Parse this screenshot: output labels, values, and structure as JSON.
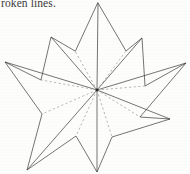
{
  "page": {
    "background_color": "#fdfdfc",
    "width": 190,
    "height": 174
  },
  "caption": {
    "text_fragment": "roken lines.",
    "color": "#2b2b2b"
  },
  "figure": {
    "name": "eight-pointed-star-polygon",
    "stroke_color": "#3a3a3a",
    "dash_color": "#9a9a9a",
    "stroke_width": 0.7,
    "center": {
      "x": 97,
      "y": 90
    },
    "outer_points": [
      {
        "label": "N",
        "x": 98,
        "y": 3
      },
      {
        "label": "NE",
        "x": 142,
        "y": 38
      },
      {
        "label": "E",
        "x": 186,
        "y": 63
      },
      {
        "label": "SE",
        "x": 170,
        "y": 119
      },
      {
        "label": "S",
        "x": 97,
        "y": 172
      },
      {
        "label": "SW",
        "x": 27,
        "y": 170
      },
      {
        "label": "W",
        "x": 5,
        "y": 62
      },
      {
        "label": "NW",
        "x": 51,
        "y": 37
      }
    ],
    "inner_points": [
      {
        "label": "i1",
        "x": 126,
        "y": 51
      },
      {
        "label": "i2",
        "x": 145,
        "y": 86
      },
      {
        "label": "i3",
        "x": 140,
        "y": 117
      },
      {
        "label": "i4",
        "x": 112,
        "y": 137
      },
      {
        "label": "i5",
        "x": 76,
        "y": 136
      },
      {
        "label": "i6",
        "x": 42,
        "y": 114
      },
      {
        "label": "i7",
        "x": 41,
        "y": 80
      },
      {
        "label": "i8",
        "x": 75,
        "y": 51
      }
    ],
    "solid_rays_to": [
      "N",
      "NE",
      "E",
      "SE",
      "S",
      "SW",
      "W",
      "NW"
    ],
    "dashed_rays_to": [
      "i1",
      "i2",
      "i3",
      "i4",
      "i5",
      "i6",
      "i7",
      "i8"
    ]
  }
}
